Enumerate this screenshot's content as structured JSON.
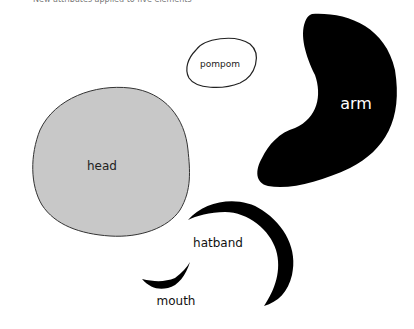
{
  "caption": "New attributes applied to five elements",
  "shapes": {
    "pompom": {
      "label": "pompom",
      "fill": "#ffffff",
      "stroke": "#222222"
    },
    "arm": {
      "label": "arm",
      "fill": "#000000",
      "text_color": "#ffffff"
    },
    "head": {
      "label": "head",
      "fill": "#c8c8c8",
      "stroke": "#333333"
    },
    "hatband": {
      "label": "hatband",
      "fill": "#000000"
    },
    "mouth": {
      "label": "mouth",
      "fill": "#000000"
    }
  }
}
